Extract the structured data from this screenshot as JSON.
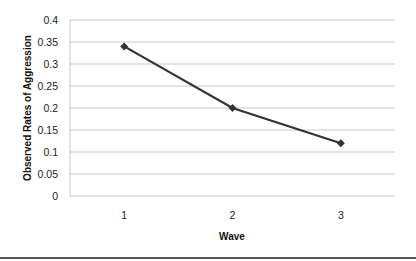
{
  "chart_data": {
    "type": "line",
    "title": "",
    "xlabel": "Wave",
    "ylabel": "Observed Rates of Aggression",
    "categories": [
      "1",
      "2",
      "3"
    ],
    "series": [
      {
        "name": "Observed Rates of Aggression",
        "values": [
          0.34,
          0.2,
          0.12
        ],
        "marker": "diamond",
        "color": "#333333"
      }
    ],
    "ylim": [
      0,
      0.4
    ],
    "yticks": [
      "0",
      "0.05",
      "0.1",
      "0.15",
      "0.2",
      "0.25",
      "0.3",
      "0.35",
      "0.4"
    ],
    "grid": true,
    "legend": null
  },
  "colors": {
    "line": "#333333",
    "grid": "#c8c8c8",
    "bottom_rule": "#555555"
  }
}
